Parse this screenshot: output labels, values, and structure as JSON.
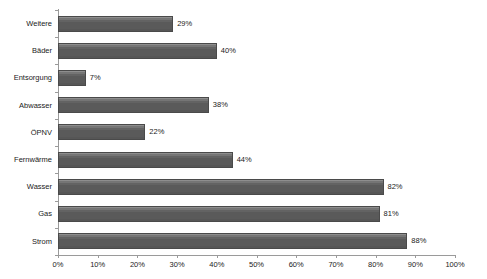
{
  "chart_data": {
    "type": "bar",
    "orientation": "horizontal",
    "title": "",
    "subtitle": "",
    "xlabel": "",
    "ylabel": "",
    "xlim": [
      0,
      100
    ],
    "grid": false,
    "legend": false,
    "value_suffix": "%",
    "bar_color": "#5c5c5c",
    "bar_border_color": "#4a4a4a",
    "axis_color": "#9a9a9a",
    "text_color": "#1a1a1a",
    "background_color": "#ffffff",
    "categories": [
      "Weitere",
      "Bäder",
      "Entsorgung",
      "Abwasser",
      "ÖPNV",
      "Fernwärme",
      "Wasser",
      "Gas",
      "Strom"
    ],
    "values": [
      29,
      40,
      7,
      38,
      22,
      44,
      82,
      81,
      88
    ],
    "value_labels": [
      "29%",
      "40%",
      "7%",
      "38%",
      "22%",
      "44%",
      "82%",
      "81%",
      "88%"
    ],
    "xticks": [
      0,
      10,
      20,
      30,
      40,
      50,
      60,
      70,
      80,
      90,
      100
    ],
    "xtick_labels": [
      "0%",
      "10%",
      "20%",
      "30%",
      "40%",
      "50%",
      "60%",
      "70%",
      "80%",
      "90%",
      "100%"
    ]
  }
}
